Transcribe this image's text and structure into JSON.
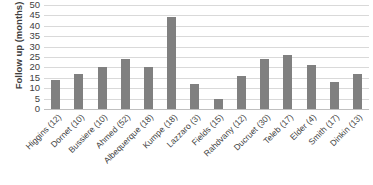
{
  "chart_data": {
    "type": "bar",
    "title": "",
    "xlabel": "",
    "ylabel": "Follow up (months)",
    "ylim": [
      0,
      50
    ],
    "ytick_step": 5,
    "yticks": [
      50,
      45,
      40,
      35,
      30,
      25,
      20,
      15,
      10,
      5,
      0
    ],
    "grid": true,
    "legend": "none",
    "bar_color": "#808080",
    "gridline_color": "#d9d9d9",
    "text_color": "#3f3f3f",
    "categories": [
      "Higgins (12)",
      "Dornet (10)",
      "Bussiere (10)",
      "Ahmed (52)",
      "Albequerque (18)",
      "Kumpe (18)",
      "Lazzaro (3)",
      "Fields (15)",
      "Rahdvany (12)",
      "Ducruet (30)",
      "Teleb (17)",
      "Elder (4)",
      "Smith (17)",
      "Dinkin (13)"
    ],
    "values": [
      14,
      17,
      20,
      24,
      20,
      44,
      12,
      5,
      16,
      24,
      26,
      21,
      13,
      17
    ]
  }
}
